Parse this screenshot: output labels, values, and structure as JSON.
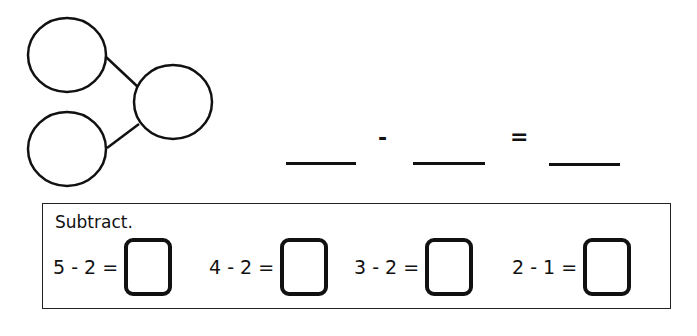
{
  "number_bond": {
    "circles": [
      {
        "id": "part-top",
        "cx": 67,
        "cy": 55
      },
      {
        "id": "whole",
        "cx": 173,
        "cy": 78
      },
      {
        "id": "part-bottom",
        "cx": 67,
        "cy": 149
      }
    ],
    "stroke_color": "#111111"
  },
  "equation": {
    "minus_sign": "-",
    "equals_sign": "="
  },
  "exercise": {
    "instruction": "Subtract.",
    "problems": [
      {
        "expression": "5 - 2 =",
        "answer": ""
      },
      {
        "expression": "4 - 2 =",
        "answer": ""
      },
      {
        "expression": "3 - 2 =",
        "answer": ""
      },
      {
        "expression": "2 - 1 =",
        "answer": ""
      }
    ]
  }
}
